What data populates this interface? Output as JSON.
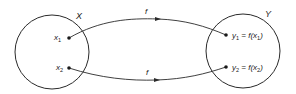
{
  "diagram": {
    "type": "function-mapping",
    "colors": {
      "stroke": "#2a2a2a",
      "text": "#1a1a1a",
      "background": "#ffffff"
    },
    "sets": [
      {
        "id": "X",
        "label": "X"
      },
      {
        "id": "Y",
        "label": "Y"
      }
    ],
    "domain_points": [
      {
        "id": "x1",
        "base": "x",
        "sub": "1"
      },
      {
        "id": "x2",
        "base": "x",
        "sub": "2"
      }
    ],
    "codomain_points": [
      {
        "id": "y1",
        "base": "y",
        "sub": "1",
        "eq": " = f(x",
        "sub2": "1",
        "close": ")"
      },
      {
        "id": "y2",
        "base": "y",
        "sub": "2",
        "eq": " = f(x",
        "sub2": "2",
        "close": ")"
      }
    ],
    "arrows": [
      {
        "from": "x1",
        "to": "y1",
        "label": "f"
      },
      {
        "from": "x2",
        "to": "y2",
        "label": "f"
      }
    ]
  }
}
